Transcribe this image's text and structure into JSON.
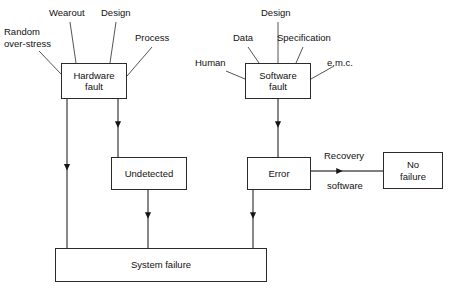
{
  "diagram": {
    "stroke_color": "#2b2b2b",
    "text_color": "#111111",
    "background": "#ffffff",
    "nodes": [
      {
        "id": "hardware_fault",
        "label": "Hardware\nfault",
        "x": 61,
        "y": 63,
        "w": 66,
        "h": 36
      },
      {
        "id": "software_fault",
        "label": "Software\nfault",
        "x": 245,
        "y": 63,
        "w": 66,
        "h": 36
      },
      {
        "id": "undetected",
        "label": "Undetected",
        "x": 111,
        "y": 157,
        "w": 76,
        "h": 33
      },
      {
        "id": "error",
        "label": "Error",
        "x": 247,
        "y": 157,
        "w": 64,
        "h": 33
      },
      {
        "id": "no_failure",
        "label": "No\nfailure",
        "x": 383,
        "y": 152,
        "w": 60,
        "h": 37
      },
      {
        "id": "system_failure",
        "label": "System failure",
        "x": 55,
        "y": 248,
        "w": 212,
        "h": 34
      }
    ],
    "input_labels": [
      {
        "id": "random_over_stress",
        "text": "Random\nover-stress",
        "x": 4,
        "y": 26,
        "align": "left"
      },
      {
        "id": "wearout",
        "text": "Wearout",
        "x": 49,
        "y": 7,
        "align": "left"
      },
      {
        "id": "design_hardware",
        "text": "Design",
        "x": 101,
        "y": 7,
        "align": "left"
      },
      {
        "id": "process",
        "text": "Process",
        "x": 135,
        "y": 32,
        "align": "left"
      },
      {
        "id": "design_software",
        "text": "Design",
        "x": 261,
        "y": 7,
        "align": "left"
      },
      {
        "id": "data",
        "text": "Data",
        "x": 233,
        "y": 32,
        "align": "left"
      },
      {
        "id": "specification",
        "text": "Specification",
        "x": 277,
        "y": 32,
        "align": "left"
      },
      {
        "id": "human",
        "text": "Human",
        "x": 195,
        "y": 57,
        "align": "left"
      },
      {
        "id": "emc",
        "text": "e.m.c.",
        "x": 327,
        "y": 57,
        "align": "left"
      }
    ],
    "edge_labels": [
      {
        "id": "recovery",
        "text": "Recovery",
        "x": 324,
        "y": 150,
        "align": "left"
      },
      {
        "id": "software",
        "text": "software",
        "x": 327,
        "y": 180,
        "align": "left"
      }
    ],
    "connectors": [
      {
        "id": "random-over-stress-to-hardware-fault",
        "type": "diagonal",
        "points": "39,51 61,74"
      },
      {
        "id": "wearout-to-hardware-fault",
        "type": "diagonal",
        "points": "70,22 76,63"
      },
      {
        "id": "design-to-hardware-fault",
        "type": "diagonal",
        "points": "116,22 110,63"
      },
      {
        "id": "process-to-hardware-fault",
        "type": "diagonal",
        "points": "152,47 127,76"
      },
      {
        "id": "human-to-software-fault",
        "type": "diagonal",
        "points": "226,71 245,79"
      },
      {
        "id": "data-to-software-fault",
        "type": "diagonal",
        "points": "248,47 259,63"
      },
      {
        "id": "design-to-software-fault",
        "type": "diagonal",
        "points": "278,22 278,63"
      },
      {
        "id": "specification-to-software-fault",
        "type": "diagonal",
        "points": "303,47 296,63"
      },
      {
        "id": "emc-to-software-fault",
        "type": "diagonal",
        "points": "334,66 311,79"
      },
      {
        "id": "hardware-fault-to-undetected",
        "type": "arrow-down",
        "points": "118,99 118,157"
      },
      {
        "id": "hardware-fault-to-system-failure",
        "type": "arrow-down",
        "points": "67,99 67,248"
      },
      {
        "id": "undetected-to-system-failure",
        "type": "arrow-down",
        "points": "148,190 148,248"
      },
      {
        "id": "software-fault-to-error",
        "type": "arrow-down",
        "points": "278,99 278,157"
      },
      {
        "id": "error-to-system-failure",
        "type": "arrow-down",
        "points": "253,190 253,248"
      },
      {
        "id": "error-to-no-failure",
        "type": "arrow-right",
        "points": "311,171 383,171"
      }
    ]
  }
}
